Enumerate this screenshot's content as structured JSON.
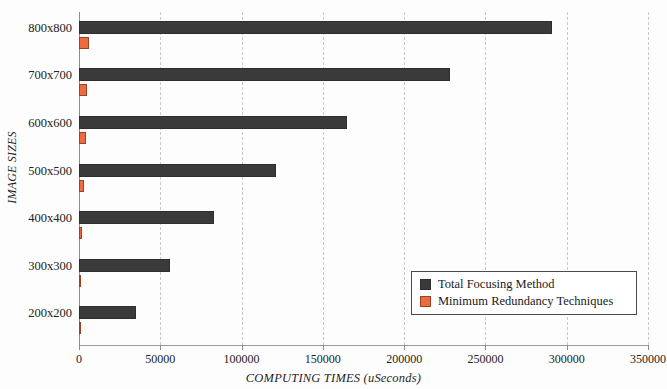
{
  "chart_data": {
    "type": "bar",
    "orientation": "horizontal",
    "title": "",
    "xlabel": "COMPUTING TIMES (uSeconds)",
    "ylabel": "IMAGE SIZES",
    "categories": [
      "800x800",
      "700x700",
      "600x600",
      "500x500",
      "400x400",
      "300x300",
      "200x200"
    ],
    "xlim": [
      0,
      350000
    ],
    "xticks": [
      0,
      50000,
      100000,
      150000,
      200000,
      250000,
      300000,
      350000
    ],
    "xtick_labels": [
      "0",
      "50000",
      "100000",
      "150000",
      "200000",
      "250000",
      "300000",
      "350000"
    ],
    "grid": "vertical-dashed",
    "legend_position": "bottom-right",
    "series": [
      {
        "name": "Total Focusing Method",
        "color": "#3a3a3a",
        "values": [
          291000,
          228000,
          165000,
          121000,
          83000,
          56000,
          35000
        ]
      },
      {
        "name": "Minimum Redundancy Techniques",
        "color": "#ed6b3f",
        "values": [
          6200,
          5200,
          4200,
          3000,
          1800,
          900,
          450
        ]
      }
    ]
  },
  "legend": {
    "items": [
      {
        "label": "Total Focusing Method",
        "color": "#3a3a3a"
      },
      {
        "label": "Minimum Redundancy Techniques",
        "color": "#ed6b3f"
      }
    ]
  },
  "colors": {
    "primary_series": "#3a3a3a",
    "secondary_series": "#ed6b3f",
    "gridline": "#c9c9c9",
    "axis": "#8c8c8c",
    "background": "#fdfdfd"
  }
}
